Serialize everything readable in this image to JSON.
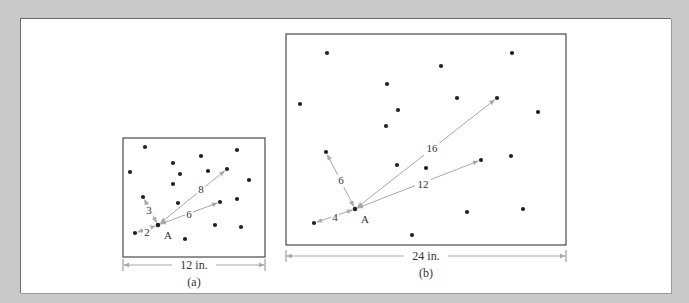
{
  "colors": {
    "background": "#c9c9c9",
    "panel": "#ffffff",
    "frame": "#4a4a4a",
    "dot": "#222222",
    "arrow": "#a8a8a8",
    "text": "#333333"
  },
  "figure_a": {
    "caption": "(a)",
    "width_label": "12 in.",
    "point_label": "A",
    "box": {
      "x": 123,
      "y": 138,
      "w": 142,
      "h": 119
    },
    "A": [
      158,
      225
    ],
    "dots": [
      [
        145,
        147
      ],
      [
        130,
        172
      ],
      [
        173,
        163
      ],
      [
        201,
        156
      ],
      [
        237,
        150
      ],
      [
        180,
        174
      ],
      [
        208,
        171
      ],
      [
        227,
        169
      ],
      [
        249,
        180
      ],
      [
        173,
        184
      ],
      [
        143,
        197
      ],
      [
        178,
        203
      ],
      [
        220,
        202
      ],
      [
        191,
        212
      ],
      [
        237,
        199
      ],
      [
        215,
        225
      ],
      [
        241,
        227
      ],
      [
        185,
        239
      ],
      [
        135,
        233
      ]
    ],
    "arrows": [
      {
        "label": "2",
        "to": [
          135,
          233
        ],
        "label_pos": [
          147,
          236
        ]
      },
      {
        "label": "3",
        "to": [
          143,
          197
        ],
        "label_pos": [
          149,
          214
        ]
      },
      {
        "label": "6",
        "to": [
          220,
          202
        ],
        "label_pos": [
          189,
          218
        ]
      },
      {
        "label": "8",
        "to": [
          227,
          169
        ],
        "label_pos": [
          201,
          193
        ]
      }
    ],
    "dimension": {
      "x1": 123,
      "x2": 265,
      "y": 265
    }
  },
  "figure_b": {
    "caption": "(b)",
    "width_label": "24 in.",
    "point_label": "A",
    "box": {
      "x": 286,
      "y": 34,
      "w": 280,
      "h": 211
    },
    "A": [
      355,
      209
    ],
    "dots": [
      [
        327,
        53
      ],
      [
        300,
        104
      ],
      [
        387,
        84
      ],
      [
        441,
        66
      ],
      [
        512,
        53
      ],
      [
        457,
        98
      ],
      [
        497,
        98
      ],
      [
        398,
        110
      ],
      [
        386,
        126
      ],
      [
        538,
        112
      ],
      [
        326,
        152
      ],
      [
        397,
        165
      ],
      [
        426,
        168
      ],
      [
        481,
        160
      ],
      [
        511,
        156
      ],
      [
        467,
        212
      ],
      [
        523,
        209
      ],
      [
        314,
        223
      ],
      [
        412,
        235
      ]
    ],
    "arrows": [
      {
        "label": "4",
        "to": [
          314,
          223
        ],
        "label_pos": [
          335,
          221
        ]
      },
      {
        "label": "6",
        "to": [
          326,
          152
        ],
        "label_pos": [
          341,
          184
        ]
      },
      {
        "label": "12",
        "to": [
          481,
          160
        ],
        "label_pos": [
          423,
          188
        ]
      },
      {
        "label": "16",
        "to": [
          497,
          98
        ],
        "label_pos": [
          432,
          152
        ]
      }
    ],
    "dimension": {
      "x1": 286,
      "x2": 566,
      "y": 256
    }
  }
}
